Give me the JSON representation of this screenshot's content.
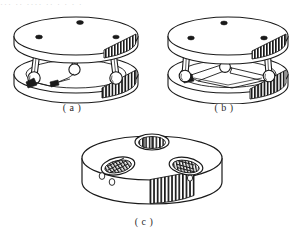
{
  "page": {
    "background_color": "#ffffff",
    "ink_color": "#1a1a1a",
    "top_clipped_text": "··· ·· ···· ·· · ·  ·  ·",
    "illustration_type": "line-drawing"
  },
  "figures": [
    {
      "id": "a",
      "caption": "( a )",
      "name": "parallel-platform-assembly-view-a",
      "description": "Two circular plates joined by three tapered legs with spherical ball joints; upper plate shown with mounting holes and a knurled band on the right rim; lower base ring with knurled band.",
      "parts": {
        "top_plate_holes": 2,
        "legs": 3,
        "ball_joints": 3,
        "knurled_bands": 2
      }
    },
    {
      "id": "b",
      "caption": "( b )",
      "name": "parallel-platform-assembly-view-b",
      "description": "Same assembly rotated; upper plate with three mounting holes and knurled band, lower base ring carrying a triangular linkage of flat arms connecting the ball joints.",
      "parts": {
        "top_plate_holes": 3,
        "legs": 3,
        "ball_joints": 3,
        "linkage_arms": 3,
        "knurled_bands": 2
      }
    },
    {
      "id": "c",
      "caption": "( c )",
      "name": "slotted-disc-component-view-c",
      "description": "Short cylindrical disc with three oval recessed pockets on the top face, each containing internal ribs; small circular holes and a vertically knurled band on the cylindrical side wall.",
      "parts": {
        "slot_pockets": 3,
        "side_holes": 3,
        "knurled_bands": 1
      }
    }
  ]
}
